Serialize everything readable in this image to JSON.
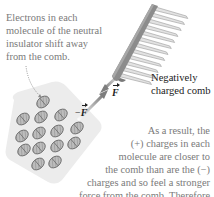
{
  "figure": {
    "annotations": {
      "electrons_note": [
        "Electrons in each",
        "molecule of the neutral",
        "insulator shift away",
        "from the comb."
      ],
      "comb_label": [
        "Negatively",
        "charged comb"
      ],
      "result_note": [
        "As a result, the",
        "(+) charges in each",
        "molecule are closer to",
        "the comb than are the (−)",
        "charges and so feel a stronger",
        "force from the comb. Therefore",
        "the net force is attractive."
      ]
    },
    "forces": {
      "on_comb": {
        "label": "F",
        "prefix": ""
      },
      "on_insulator": {
        "label": "F",
        "prefix": "−"
      }
    },
    "colors": {
      "text_gray": "#7a7a7a",
      "comb_dark": "#8c8c8c",
      "comb_light": "#d0d0d0",
      "insulator": "#ececec",
      "molecule": "#9a9a9a",
      "arrow": "#8a8a8a"
    },
    "molecules": [
      {
        "x": 43,
        "y": 102
      },
      {
        "x": 23,
        "y": 119
      },
      {
        "x": 41,
        "y": 117
      },
      {
        "x": 61,
        "y": 115
      },
      {
        "x": 22,
        "y": 136
      },
      {
        "x": 39,
        "y": 133
      },
      {
        "x": 57,
        "y": 131
      },
      {
        "x": 77,
        "y": 128
      },
      {
        "x": 24,
        "y": 150
      },
      {
        "x": 39,
        "y": 148
      },
      {
        "x": 57,
        "y": 146
      },
      {
        "x": 74,
        "y": 143
      },
      {
        "x": 38,
        "y": 164
      },
      {
        "x": 55,
        "y": 162
      }
    ]
  }
}
